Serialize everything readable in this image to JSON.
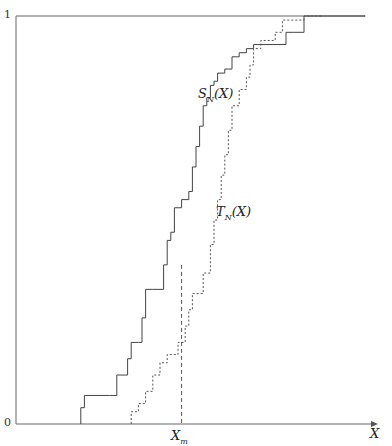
{
  "chart_data": {
    "type": "line",
    "subtype": "step (empirical CDF)",
    "title": "",
    "xlabel": "X",
    "ylabel": "",
    "yticks": [
      "0",
      "1"
    ],
    "ylim": [
      0,
      1
    ],
    "xticks": [
      "X_m"
    ],
    "grid": false,
    "legend": "inline labels",
    "annotations": [
      {
        "text": "S_N(X)",
        "near_series": "S_N(X)"
      },
      {
        "text": "T_N(X)",
        "near_series": "T_N(X)"
      },
      {
        "text": "X_m",
        "type": "vertical dashed line",
        "x": 0.46
      }
    ],
    "series": [
      {
        "name": "S_N(X)",
        "style": "solid",
        "x": [
          0.0,
          0.18,
          0.19,
          0.26,
          0.28,
          0.3,
          0.31,
          0.32,
          0.34,
          0.35,
          0.36,
          0.38,
          0.41,
          0.42,
          0.43,
          0.44,
          0.46,
          0.48,
          0.49,
          0.5,
          0.51,
          0.52,
          0.53,
          0.54,
          0.55,
          0.56,
          0.58,
          0.6,
          0.62,
          0.64,
          0.66,
          0.75,
          0.77,
          0.8,
          0.85,
          0.97
        ],
        "y": [
          0.0,
          0.04,
          0.07,
          0.07,
          0.12,
          0.12,
          0.16,
          0.2,
          0.2,
          0.26,
          0.33,
          0.33,
          0.39,
          0.45,
          0.47,
          0.53,
          0.55,
          0.57,
          0.63,
          0.68,
          0.73,
          0.78,
          0.8,
          0.83,
          0.84,
          0.86,
          0.87,
          0.9,
          0.91,
          0.92,
          0.93,
          0.96,
          0.96,
          1.0,
          1.0,
          1.0
        ]
      },
      {
        "name": "T_N(X)",
        "style": "dashed",
        "x": [
          0.0,
          0.32,
          0.34,
          0.36,
          0.38,
          0.4,
          0.42,
          0.45,
          0.47,
          0.48,
          0.49,
          0.52,
          0.54,
          0.55,
          0.56,
          0.57,
          0.58,
          0.59,
          0.6,
          0.62,
          0.64,
          0.65,
          0.66,
          0.68,
          0.72,
          0.74,
          0.8,
          0.85
        ],
        "y": [
          0.0,
          0.03,
          0.05,
          0.08,
          0.12,
          0.15,
          0.17,
          0.2,
          0.24,
          0.28,
          0.32,
          0.37,
          0.44,
          0.5,
          0.55,
          0.61,
          0.66,
          0.72,
          0.78,
          0.82,
          0.85,
          0.88,
          0.92,
          0.94,
          0.96,
          0.99,
          1.0,
          1.0
        ]
      }
    ]
  },
  "labels": {
    "y_top": "1",
    "y_bottom": "0",
    "x_axis": "X",
    "x_marker": "X",
    "x_marker_sub": "m",
    "s_label": "S",
    "s_label_sub": "N",
    "s_label_arg": "(X)",
    "t_label": "T",
    "t_label_sub": "N",
    "t_label_arg": "(X)"
  },
  "colors": {
    "axis": "#555555",
    "solid_series": "#444444",
    "dashed_series": "#555555"
  }
}
